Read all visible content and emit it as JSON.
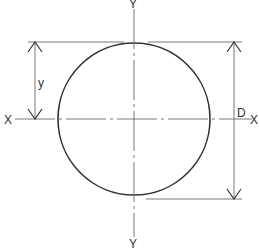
{
  "diagram": {
    "type": "circular cross-section",
    "labels": {
      "axis_x_left": "X",
      "axis_x_right": "X",
      "axis_y_top": "Y",
      "axis_y_bottom": "Y",
      "dim_y": "y",
      "dim_D": "D"
    },
    "colors": {
      "outline": "#333333",
      "thin": "#6a6a6a",
      "background": "#ffffff"
    }
  }
}
